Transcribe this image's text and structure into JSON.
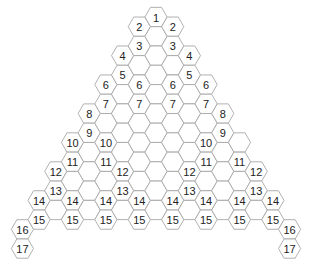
{
  "diagram": {
    "type": "hexagonal-triangle-grid",
    "colors": {
      "stroke": "#a8a8a8",
      "fill": "#ffffff",
      "text": "#222222"
    },
    "geometry": {
      "center_x": 156,
      "top_y": 17,
      "col_spacing": 16.7,
      "row_height": 19.3,
      "hex_radius": 11.1
    },
    "columns": [
      {
        "c": -8,
        "top_half_rows": 22,
        "bottom_half_rows": 24
      },
      {
        "c": -7,
        "top_half_rows": 19,
        "bottom_half_rows": 21
      },
      {
        "c": -6,
        "top_half_rows": 16,
        "bottom_half_rows": 20
      },
      {
        "c": -5,
        "top_half_rows": 13,
        "bottom_half_rows": 21
      },
      {
        "c": -4,
        "top_half_rows": 10,
        "bottom_half_rows": 20
      },
      {
        "c": -3,
        "top_half_rows": 7,
        "bottom_half_rows": 21
      },
      {
        "c": -2,
        "top_half_rows": 4,
        "bottom_half_rows": 20
      },
      {
        "c": -1,
        "top_half_rows": 1,
        "bottom_half_rows": 21
      },
      {
        "c": 0,
        "top_half_rows": 0,
        "bottom_half_rows": 20
      },
      {
        "c": 1,
        "top_half_rows": 1,
        "bottom_half_rows": 21
      },
      {
        "c": 2,
        "top_half_rows": 4,
        "bottom_half_rows": 20
      },
      {
        "c": 3,
        "top_half_rows": 7,
        "bottom_half_rows": 21
      },
      {
        "c": 4,
        "top_half_rows": 10,
        "bottom_half_rows": 20
      },
      {
        "c": 5,
        "top_half_rows": 13,
        "bottom_half_rows": 21
      },
      {
        "c": 6,
        "top_half_rows": 16,
        "bottom_half_rows": 20
      },
      {
        "c": 7,
        "top_half_rows": 19,
        "bottom_half_rows": 21
      },
      {
        "c": 8,
        "top_half_rows": 22,
        "bottom_half_rows": 24
      }
    ],
    "labels": [
      {
        "text": "1",
        "c": 0,
        "hr": 0
      },
      {
        "text": "2",
        "c": -1,
        "hr": 1
      },
      {
        "text": "2",
        "c": 1,
        "hr": 1
      },
      {
        "text": "3",
        "c": -1,
        "hr": 3
      },
      {
        "text": "3",
        "c": 1,
        "hr": 3
      },
      {
        "text": "4",
        "c": -2,
        "hr": 4
      },
      {
        "text": "4",
        "c": 2,
        "hr": 4
      },
      {
        "text": "5",
        "c": -2,
        "hr": 6
      },
      {
        "text": "5",
        "c": 2,
        "hr": 6
      },
      {
        "text": "6",
        "c": -3,
        "hr": 7
      },
      {
        "text": "6",
        "c": -1,
        "hr": 7
      },
      {
        "text": "6",
        "c": 1,
        "hr": 7
      },
      {
        "text": "6",
        "c": 3,
        "hr": 7
      },
      {
        "text": "7",
        "c": -3,
        "hr": 9
      },
      {
        "text": "7",
        "c": -1,
        "hr": 9
      },
      {
        "text": "7",
        "c": 1,
        "hr": 9
      },
      {
        "text": "7",
        "c": 3,
        "hr": 9
      },
      {
        "text": "8",
        "c": -4,
        "hr": 10
      },
      {
        "text": "8",
        "c": 4,
        "hr": 10
      },
      {
        "text": "9",
        "c": -4,
        "hr": 12
      },
      {
        "text": "9",
        "c": 4,
        "hr": 12
      },
      {
        "text": "10",
        "c": -5,
        "hr": 13
      },
      {
        "text": "10",
        "c": -3,
        "hr": 13
      },
      {
        "text": "10",
        "c": 3,
        "hr": 13
      },
      {
        "text": "11",
        "c": -5,
        "hr": 15
      },
      {
        "text": "11",
        "c": -3,
        "hr": 15
      },
      {
        "text": "11",
        "c": 3,
        "hr": 15
      },
      {
        "text": "11",
        "c": 5,
        "hr": 15
      },
      {
        "text": "12",
        "c": -6,
        "hr": 16
      },
      {
        "text": "12",
        "c": -2,
        "hr": 16
      },
      {
        "text": "12",
        "c": 2,
        "hr": 16
      },
      {
        "text": "12",
        "c": 6,
        "hr": 16
      },
      {
        "text": "13",
        "c": -6,
        "hr": 18
      },
      {
        "text": "13",
        "c": -2,
        "hr": 18
      },
      {
        "text": "13",
        "c": 2,
        "hr": 18
      },
      {
        "text": "13",
        "c": 6,
        "hr": 18
      },
      {
        "text": "14",
        "c": -7,
        "hr": 19
      },
      {
        "text": "14",
        "c": -5,
        "hr": 19
      },
      {
        "text": "14",
        "c": -3,
        "hr": 19
      },
      {
        "text": "14",
        "c": -1,
        "hr": 19
      },
      {
        "text": "14",
        "c": 1,
        "hr": 19
      },
      {
        "text": "14",
        "c": 3,
        "hr": 19
      },
      {
        "text": "14",
        "c": 5,
        "hr": 19
      },
      {
        "text": "14",
        "c": 7,
        "hr": 19
      },
      {
        "text": "15",
        "c": -7,
        "hr": 21
      },
      {
        "text": "15",
        "c": -5,
        "hr": 21
      },
      {
        "text": "15",
        "c": -3,
        "hr": 21
      },
      {
        "text": "15",
        "c": -1,
        "hr": 21
      },
      {
        "text": "15",
        "c": 1,
        "hr": 21
      },
      {
        "text": "15",
        "c": 3,
        "hr": 21
      },
      {
        "text": "15",
        "c": 5,
        "hr": 21
      },
      {
        "text": "15",
        "c": 7,
        "hr": 21
      },
      {
        "text": "16",
        "c": -8,
        "hr": 22
      },
      {
        "text": "16",
        "c": 8,
        "hr": 22
      },
      {
        "text": "17",
        "c": -8,
        "hr": 24
      },
      {
        "text": "17",
        "c": 8,
        "hr": 24
      }
    ]
  }
}
